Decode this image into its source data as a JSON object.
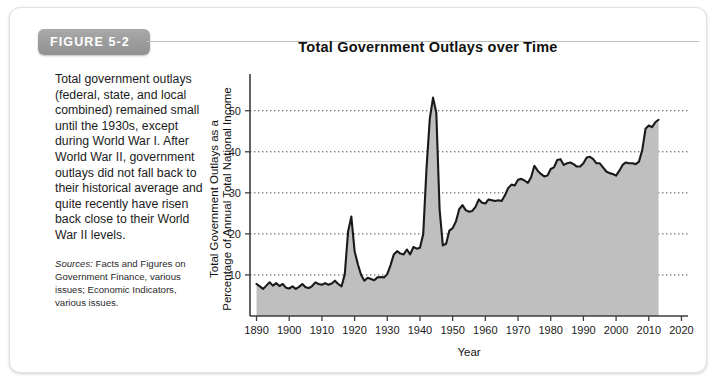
{
  "figure": {
    "badge_label": "FIGURE 5-2",
    "title": "Total Government Outlays over Time",
    "caption": "Total government outlays (federal, state, and local combined) remained small until the 1930s, except during World War I. After World War II, government outlays did not fall back to their historical average and quite recently have risen back close to their World War II levels.",
    "sources_label": "Sources:",
    "sources_text": "Facts and Figures on Government Finance, various issues; Economic Indicators, various issues."
  },
  "colors": {
    "badge": "#9b9b9b",
    "area_fill": "#bfbfbf",
    "line": "#1a1a1a",
    "axis": "#3d3d3d",
    "panel_border": "#e2e2e2",
    "grid": "#4a4a4a"
  },
  "chart_data": {
    "type": "area",
    "title": "Total Government Outlays over Time",
    "xlabel": "Year",
    "ylabel": "Total Government Outlays as a Percentage of Annual Total National Income",
    "ylabel_line1": "Total Government Outlays as a",
    "ylabel_line2": "Percentage of Annual Total National Income",
    "xlim": [
      1888,
      2022
    ],
    "ylim": [
      0,
      57
    ],
    "xticks": [
      1890,
      1900,
      1910,
      1920,
      1930,
      1940,
      1950,
      1960,
      1970,
      1980,
      1990,
      2000,
      2010,
      2020
    ],
    "yticks": [
      10,
      20,
      30,
      40,
      50
    ],
    "grid": "horizontal-dotted",
    "legend": "none",
    "series_name": "Total government outlays as % of national income",
    "x": [
      1890,
      1891,
      1892,
      1893,
      1894,
      1895,
      1896,
      1897,
      1898,
      1899,
      1900,
      1901,
      1902,
      1903,
      1904,
      1905,
      1906,
      1907,
      1908,
      1909,
      1910,
      1911,
      1912,
      1913,
      1914,
      1915,
      1916,
      1917,
      1918,
      1919,
      1920,
      1921,
      1922,
      1923,
      1924,
      1925,
      1926,
      1927,
      1928,
      1929,
      1930,
      1931,
      1932,
      1933,
      1934,
      1935,
      1936,
      1937,
      1938,
      1939,
      1940,
      1941,
      1942,
      1943,
      1944,
      1945,
      1946,
      1947,
      1948,
      1949,
      1950,
      1951,
      1952,
      1953,
      1954,
      1955,
      1956,
      1957,
      1958,
      1959,
      1960,
      1961,
      1962,
      1963,
      1964,
      1965,
      1966,
      1967,
      1968,
      1969,
      1970,
      1971,
      1972,
      1973,
      1974,
      1975,
      1976,
      1977,
      1978,
      1979,
      1980,
      1981,
      1982,
      1983,
      1984,
      1985,
      1986,
      1987,
      1988,
      1989,
      1990,
      1991,
      1992,
      1993,
      1994,
      1995,
      1996,
      1997,
      1998,
      1999,
      2000,
      2001,
      2002,
      2003,
      2004,
      2005,
      2006,
      2007,
      2008,
      2009,
      2010,
      2011,
      2012,
      2013
    ],
    "values": [
      7.8,
      7.2,
      6.6,
      7.4,
      8.2,
      7.4,
      8.0,
      7.3,
      7.8,
      6.9,
      6.7,
      7.2,
      6.6,
      7.1,
      7.8,
      7.0,
      6.8,
      7.3,
      8.2,
      7.8,
      7.6,
      8.0,
      7.6,
      7.9,
      8.6,
      7.8,
      7.2,
      10.2,
      20.5,
      24.2,
      15.8,
      12.6,
      10.0,
      8.6,
      9.3,
      9.0,
      8.7,
      9.4,
      9.5,
      9.4,
      10.2,
      12.4,
      15.0,
      15.8,
      15.2,
      15.0,
      16.2,
      15.0,
      16.8,
      16.4,
      16.6,
      20.0,
      36.0,
      48.0,
      53.2,
      49.5,
      26.0,
      17.2,
      17.6,
      20.8,
      21.4,
      23.0,
      26.0,
      27.0,
      25.8,
      25.4,
      25.6,
      26.6,
      28.4,
      27.6,
      27.4,
      28.4,
      28.2,
      28.0,
      28.2,
      28.0,
      29.4,
      31.2,
      32.0,
      31.8,
      33.2,
      33.4,
      33.0,
      32.4,
      33.8,
      36.6,
      35.4,
      34.6,
      34.0,
      34.2,
      35.8,
      36.2,
      38.0,
      38.2,
      36.8,
      37.2,
      37.4,
      37.0,
      36.4,
      36.4,
      37.2,
      38.6,
      38.8,
      38.2,
      37.2,
      37.2,
      36.2,
      35.2,
      34.8,
      34.6,
      34.2,
      35.4,
      36.8,
      37.4,
      37.2,
      37.2,
      37.0,
      37.6,
      40.4,
      45.6,
      46.4,
      46.0,
      47.2,
      47.8
    ]
  }
}
